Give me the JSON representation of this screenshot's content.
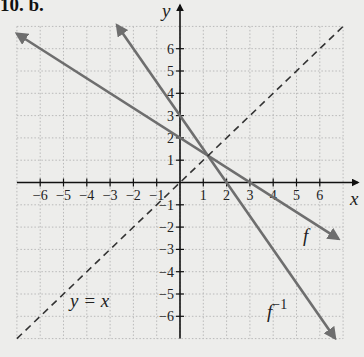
{
  "title": "10. b.",
  "chart_data": {
    "type": "line",
    "title": "10. b.",
    "xlabel": "x",
    "ylabel": "y",
    "xlim": [
      -7,
      7
    ],
    "ylim": [
      -7,
      7
    ],
    "grid": true,
    "x_ticks": [
      -6,
      -5,
      -4,
      -3,
      -2,
      -1,
      1,
      2,
      3,
      4,
      5,
      6
    ],
    "y_ticks": [
      -6,
      -5,
      -4,
      -3,
      -2,
      -1,
      1,
      2,
      3,
      4,
      5,
      6
    ],
    "series": [
      {
        "name": "f",
        "label": "f",
        "equation": "y = -2/3 x + 2",
        "style": "solid",
        "color": "#6e6e6e",
        "x": [
          -7,
          6.8
        ],
        "y": [
          6.67,
          -2.53
        ],
        "arrows": "both"
      },
      {
        "name": "f^-1",
        "label": "f",
        "label_sup": "−1",
        "equation": "y = -3/2 x + 3",
        "style": "solid",
        "color": "#6e6e6e",
        "x": [
          -2.7,
          6.65
        ],
        "y": [
          7.05,
          -6.98
        ],
        "arrows": "both"
      },
      {
        "name": "y = x",
        "label": "y = x",
        "equation": "y = x",
        "style": "dashed",
        "color": "#333333",
        "x": [
          -7,
          7
        ],
        "y": [
          -7,
          7
        ],
        "arrows": "none"
      }
    ],
    "intersection": {
      "x": 1.2,
      "y": 1.2
    }
  },
  "labels": {
    "x_axis": "x",
    "y_axis": "y",
    "f": "f",
    "finv_base": "f",
    "finv_sup": "−1",
    "yx": "y = x"
  }
}
